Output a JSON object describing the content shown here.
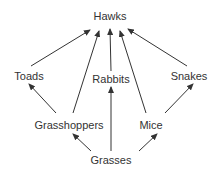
{
  "diagram": {
    "type": "food web",
    "nodes": [
      {
        "id": "hawks",
        "label": "Hawks",
        "x": 110,
        "y": 16
      },
      {
        "id": "toads",
        "label": "Toads",
        "x": 29,
        "y": 76
      },
      {
        "id": "rabbits",
        "label": "Rabbits",
        "x": 111,
        "y": 79
      },
      {
        "id": "snakes",
        "label": "Snakes",
        "x": 189,
        "y": 76
      },
      {
        "id": "grasshoppers",
        "label": "Grasshoppers",
        "x": 69,
        "y": 125
      },
      {
        "id": "mice",
        "label": "Mice",
        "x": 151,
        "y": 125
      },
      {
        "id": "grasses",
        "label": "Grasses",
        "x": 111,
        "y": 160
      }
    ],
    "edges": [
      {
        "from": "toads",
        "to": "hawks"
      },
      {
        "from": "grasshoppers",
        "to": "hawks"
      },
      {
        "from": "rabbits",
        "to": "hawks"
      },
      {
        "from": "mice",
        "to": "hawks"
      },
      {
        "from": "snakes",
        "to": "hawks"
      },
      {
        "from": "grasshoppers",
        "to": "toads"
      },
      {
        "from": "mice",
        "to": "snakes"
      },
      {
        "from": "grasses",
        "to": "rabbits"
      },
      {
        "from": "grasses",
        "to": "grasshoppers"
      },
      {
        "from": "grasses",
        "to": "mice"
      }
    ],
    "colors": {
      "line": "#333333",
      "text": "#333333"
    }
  }
}
